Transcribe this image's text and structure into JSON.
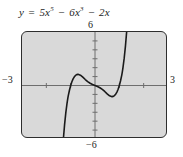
{
  "figure": {
    "equation": {
      "lhs": "y",
      "equals": "=",
      "terms": [
        {
          "coef": "5x",
          "exp": "5",
          "op": ""
        },
        {
          "coef": "6x",
          "exp": "3",
          "op": "−"
        },
        {
          "coef": "2x",
          "exp": "",
          "op": "−"
        }
      ],
      "plain_text": "y = 5x⁵ − 6x³ − 2x"
    },
    "axis_labels": {
      "top": "6",
      "bottom": "−6",
      "left": "−3",
      "right": "3"
    },
    "colors": {
      "plot_background": "#d9d9d9",
      "frame_border": "#2e2e2e",
      "curve": "#1a1a1a",
      "axis": "#6e6e6e",
      "page_background": "#ffffff",
      "text": "#1b1b1b"
    }
  },
  "chart_data": {
    "type": "line",
    "xlabel": "x",
    "ylabel": "y",
    "xlim": [
      -3,
      3
    ],
    "ylim": [
      -6,
      6
    ],
    "grid": false,
    "legend": null,
    "x_ticks": [
      -3,
      -2,
      -1,
      0,
      1,
      2,
      3
    ],
    "y_ticks": [
      -6,
      -5,
      -4,
      -3,
      -2,
      -1,
      0,
      1,
      2,
      3,
      4,
      5,
      6
    ],
    "x_tick_labels": [
      "−3",
      "",
      "",
      "",
      "",
      "",
      "3"
    ],
    "y_tick_labels": [
      "−6",
      "",
      "",
      "",
      "",
      "",
      "",
      "",
      "",
      "",
      "",
      "",
      "6"
    ],
    "function": "5*x**5 - 6*x**3 - 2*x",
    "series": [
      {
        "name": "y = 5x⁵ − 6x³ − 2x",
        "x": [
          -1.3,
          -1.25,
          -1.2,
          -1.15,
          -1.12,
          -1.1,
          -1.05,
          -1.0,
          -0.95,
          -0.9,
          -0.85,
          -0.8,
          -0.75,
          -0.7,
          -0.6,
          -0.5,
          -0.4,
          -0.3,
          -0.2,
          -0.1,
          0.0,
          0.1,
          0.2,
          0.3,
          0.4,
          0.5,
          0.6,
          0.7,
          0.75,
          0.8,
          0.85,
          0.9,
          0.95,
          1.0,
          1.05,
          1.1,
          1.12,
          1.15,
          1.2,
          1.25,
          1.3
        ],
        "y": [
          -6.0,
          -4.39,
          -3.07,
          -2.01,
          -1.48,
          -1.17,
          -0.53,
          -0.0,
          0.42,
          0.74,
          0.97,
          1.13,
          1.22,
          1.25,
          1.16,
          0.94,
          0.67,
          0.44,
          0.25,
          0.11,
          0.0,
          -0.11,
          -0.25,
          -0.44,
          -0.67,
          -0.94,
          -1.16,
          -1.25,
          -1.22,
          -1.13,
          -0.97,
          -0.74,
          -0.42,
          0.0,
          0.53,
          1.17,
          1.48,
          2.01,
          3.07,
          4.39,
          6.0
        ]
      }
    ],
    "features": {
      "local_maximum": {
        "x": -0.7,
        "y": 1.25
      },
      "local_minimum": {
        "x": 0.7,
        "y": -1.25
      },
      "x_intercepts": [
        -1.0,
        0.0,
        1.0
      ],
      "y_intercept": 0.0,
      "shape": "quintic with S-shape; steep descending branch at left and steep ascending branch at right"
    }
  }
}
